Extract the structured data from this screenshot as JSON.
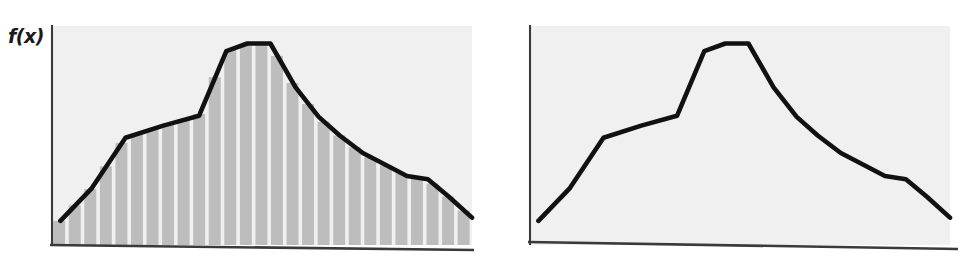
{
  "figure": {
    "title": "",
    "background_color": "#ffffff",
    "panel_fill_color": "#f0f0f0",
    "bar_fill_color": "#bdbdbd",
    "curve_color": "#111111",
    "axis_color": "#3a3a3a"
  },
  "panels": [
    {
      "id": "left",
      "axis_label": "f(x)",
      "has_bars": true,
      "caption": ""
    },
    {
      "id": "right",
      "axis_label": "f(x)",
      "has_bars": false,
      "caption": ""
    }
  ],
  "chart_data": [
    {
      "type": "area",
      "id": "left-panel-riemann-sum",
      "title": "",
      "xlabel": "",
      "ylabel": "f(x)",
      "grid": false,
      "legend": null,
      "xlim": [
        0,
        100
      ],
      "ylim": [
        0,
        100
      ],
      "notes": "Function curve f(x) with shaded vertical rectangular strips (Riemann-sum style partition) filling the area under the curve.",
      "bar_count": 27,
      "x": [
        2.0,
        9.5,
        17.5,
        26.5,
        35.0,
        41.5,
        46.5,
        52.0,
        58.0,
        63.5,
        68.5,
        74.0,
        79.5,
        84.5,
        89.5,
        94.5,
        100.0
      ],
      "y": [
        11.0,
        26.0,
        49.0,
        54.5,
        59.0,
        88.5,
        92.0,
        92.0,
        72.0,
        58.5,
        50.0,
        42.0,
        36.5,
        31.5,
        30.0,
        22.0,
        12.5
      ],
      "vertices": [
        {
          "x": 2.0,
          "y": 11.0
        },
        {
          "x": 9.5,
          "y": 26.0
        },
        {
          "x": 17.5,
          "y": 49.0
        },
        {
          "x": 26.5,
          "y": 54.5
        },
        {
          "x": 35.0,
          "y": 59.0
        },
        {
          "x": 41.5,
          "y": 88.5
        },
        {
          "x": 46.5,
          "y": 92.0
        },
        {
          "x": 52.0,
          "y": 92.0
        },
        {
          "x": 58.0,
          "y": 72.0
        },
        {
          "x": 63.5,
          "y": 58.5
        },
        {
          "x": 68.5,
          "y": 50.0
        },
        {
          "x": 74.0,
          "y": 42.0
        },
        {
          "x": 79.5,
          "y": 36.5
        },
        {
          "x": 84.5,
          "y": 31.5
        },
        {
          "x": 89.5,
          "y": 30.0
        },
        {
          "x": 94.5,
          "y": 22.0
        },
        {
          "x": 100.0,
          "y": 12.5
        }
      ]
    },
    {
      "type": "line",
      "id": "right-panel-curve",
      "title": "",
      "xlabel": "",
      "ylabel": "f(x)",
      "grid": false,
      "legend": null,
      "xlim": [
        0,
        100
      ],
      "ylim": [
        0,
        100
      ],
      "notes": "Same function curve f(x) without the shaded partition rectangles.",
      "x": [
        2.0,
        9.5,
        17.5,
        26.5,
        35.0,
        41.5,
        46.5,
        52.0,
        58.0,
        63.5,
        68.5,
        74.0,
        79.5,
        84.5,
        89.5,
        94.5,
        100.0
      ],
      "y": [
        11.0,
        26.0,
        49.0,
        54.5,
        59.0,
        88.5,
        92.0,
        92.0,
        72.0,
        58.5,
        50.0,
        42.0,
        36.5,
        31.5,
        30.0,
        22.0,
        12.5
      ],
      "vertices": [
        {
          "x": 2.0,
          "y": 11.0
        },
        {
          "x": 9.5,
          "y": 26.0
        },
        {
          "x": 17.5,
          "y": 49.0
        },
        {
          "x": 26.5,
          "y": 54.5
        },
        {
          "x": 35.0,
          "y": 59.0
        },
        {
          "x": 41.5,
          "y": 88.5
        },
        {
          "x": 46.5,
          "y": 92.0
        },
        {
          "x": 52.0,
          "y": 92.0
        },
        {
          "x": 58.0,
          "y": 72.0
        },
        {
          "x": 63.5,
          "y": 58.5
        },
        {
          "x": 68.5,
          "y": 50.0
        },
        {
          "x": 74.0,
          "y": 42.0
        },
        {
          "x": 79.5,
          "y": 36.5
        },
        {
          "x": 84.5,
          "y": 31.5
        },
        {
          "x": 89.5,
          "y": 30.0
        },
        {
          "x": 94.5,
          "y": 22.0
        },
        {
          "x": 100.0,
          "y": 12.5
        }
      ]
    }
  ]
}
